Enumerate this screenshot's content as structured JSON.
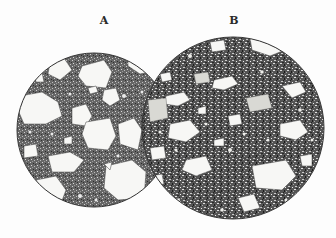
{
  "figure": {
    "labels": {
      "a": "A",
      "b": "B"
    },
    "colors": {
      "background": "#fdfdfd",
      "matrix_a": "#5e5e5e",
      "matrix_b": "#4a4a4a",
      "grain": "#f7f7f5",
      "outline": "#333333"
    },
    "circles": {
      "a": {
        "cx": 94,
        "cy": 130,
        "r": 77
      },
      "b": {
        "cx": 233,
        "cy": 128,
        "r": 91
      }
    }
  }
}
